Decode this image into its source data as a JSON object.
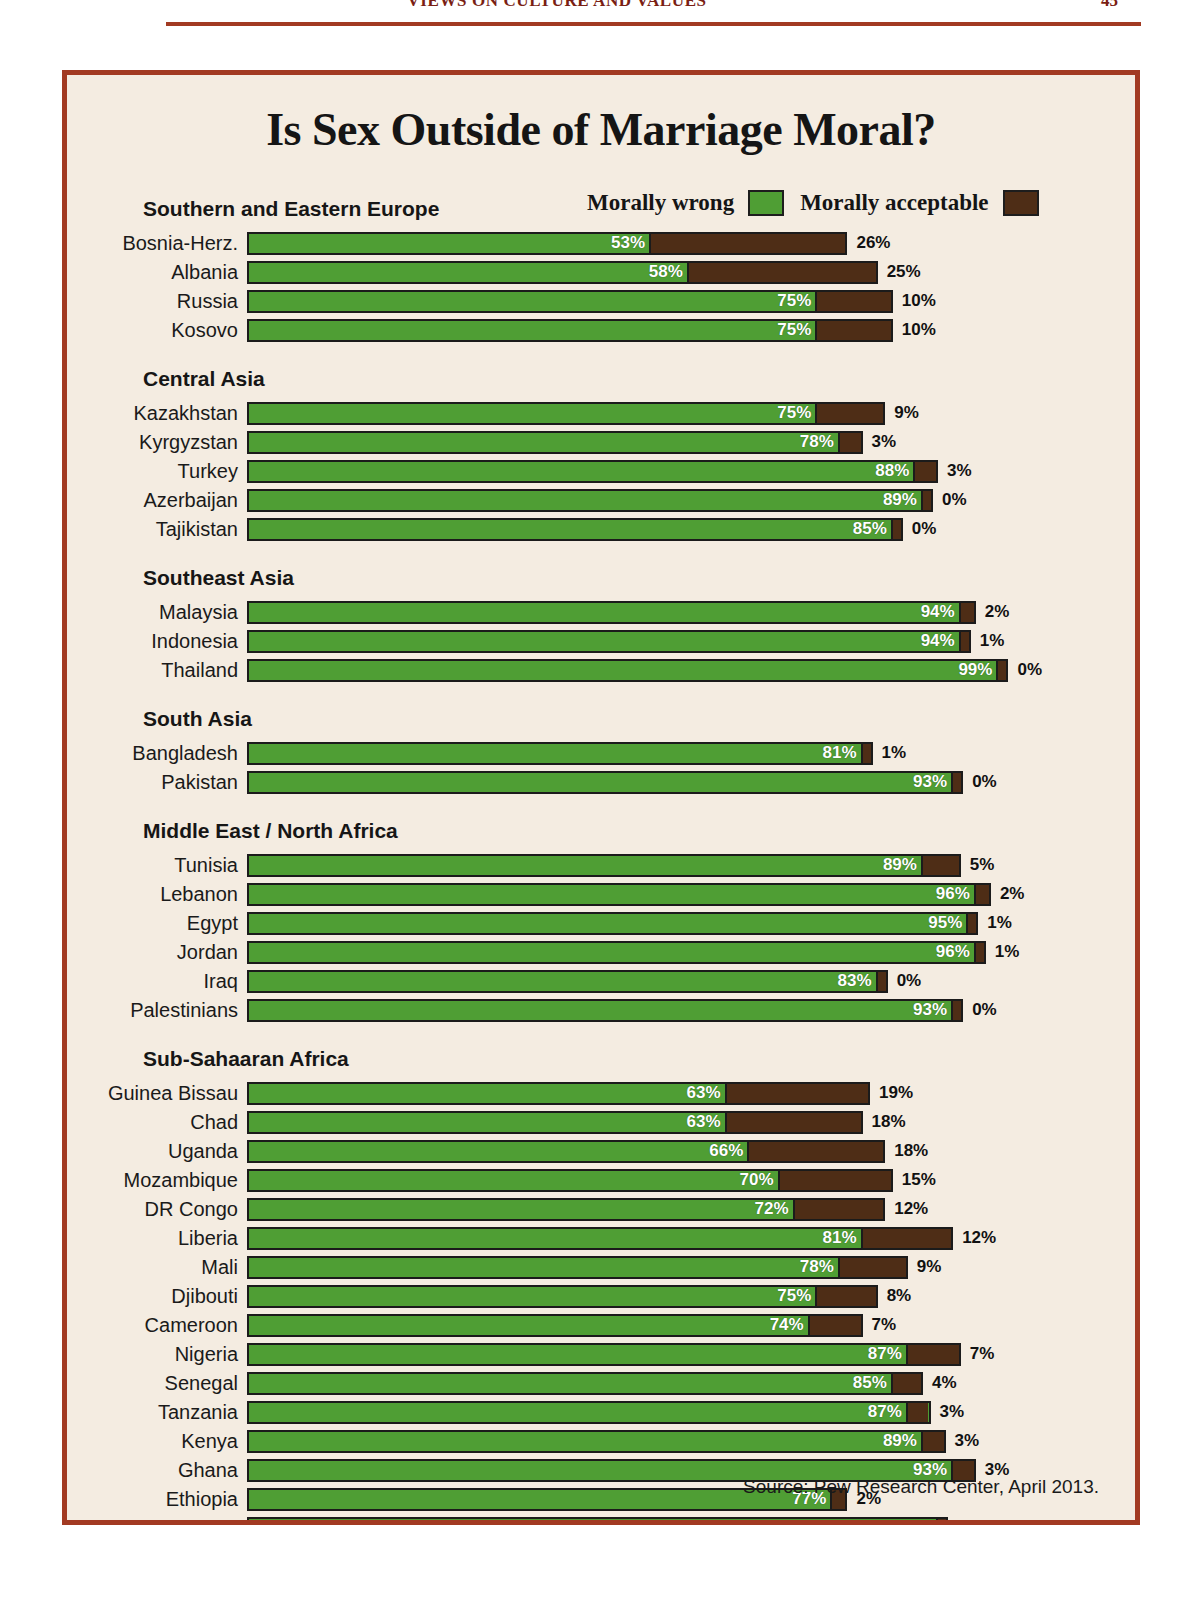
{
  "page_header": {
    "running_head": "VIEWS ON CULTURE AND VALUES",
    "page_number": "45"
  },
  "figure": {
    "title": "Is Sex Outside of Marriage Moral?",
    "source": "Source: Pew Research Center, April 2013.",
    "legend": [
      {
        "label": "Morally wrong",
        "color": "#4f9e34",
        "key": "green"
      },
      {
        "label": "Morally acceptable",
        "color": "#4e2d16",
        "key": "brown"
      }
    ]
  },
  "colors": {
    "frame": "#a23a22",
    "paper": "#f4ece1",
    "morally_wrong": "#4f9e34",
    "morally_acceptable": "#4e2d16",
    "outline": "#1b1b1b"
  },
  "chart_data": {
    "type": "bar",
    "orientation": "horizontal",
    "stacked": true,
    "title": "Is Sex Outside of Marriage Moral?",
    "xlabel": "",
    "ylabel": "",
    "xlim": [
      0,
      100
    ],
    "unit": "%",
    "grid": false,
    "legend_position": "top-right",
    "series": [
      {
        "name": "Morally wrong",
        "color": "#4f9e34"
      },
      {
        "name": "Morally acceptable",
        "color": "#4e2d16"
      }
    ],
    "groups": [
      {
        "name": "Southern and Eastern Europe",
        "rows": [
          {
            "country": "Bosnia-Herz.",
            "wrong": 53,
            "acceptable": 26,
            "wrong_label": "53%",
            "acceptable_label": "26%"
          },
          {
            "country": "Albania",
            "wrong": 58,
            "acceptable": 25,
            "wrong_label": "58%",
            "acceptable_label": "25%"
          },
          {
            "country": "Russia",
            "wrong": 75,
            "acceptable": 10,
            "wrong_label": "75%",
            "acceptable_label": "10%"
          },
          {
            "country": "Kosovo",
            "wrong": 75,
            "acceptable": 10,
            "wrong_label": "75%",
            "acceptable_label": "10%"
          }
        ]
      },
      {
        "name": "Central Asia",
        "rows": [
          {
            "country": "Kazakhstan",
            "wrong": 75,
            "acceptable": 9,
            "wrong_label": "75%",
            "acceptable_label": "9%"
          },
          {
            "country": "Kyrgyzstan",
            "wrong": 78,
            "acceptable": 3,
            "wrong_label": "78%",
            "acceptable_label": "3%"
          },
          {
            "country": "Turkey",
            "wrong": 88,
            "acceptable": 3,
            "wrong_label": "88%",
            "acceptable_label": "3%"
          },
          {
            "country": "Azerbaijan",
            "wrong": 89,
            "acceptable": 0,
            "wrong_label": "89%",
            "acceptable_label": "0%"
          },
          {
            "country": "Tajikistan",
            "wrong": 85,
            "acceptable": 0,
            "wrong_label": "85%",
            "acceptable_label": "0%"
          }
        ]
      },
      {
        "name": "Southeast Asia",
        "rows": [
          {
            "country": "Malaysia",
            "wrong": 94,
            "acceptable": 2,
            "wrong_label": "94%",
            "acceptable_label": "2%"
          },
          {
            "country": "Indonesia",
            "wrong": 94,
            "acceptable": 1,
            "wrong_label": "94%",
            "acceptable_label": "1%"
          },
          {
            "country": "Thailand",
            "wrong": 99,
            "acceptable": 0,
            "wrong_label": "99%",
            "acceptable_label": "0%"
          }
        ]
      },
      {
        "name": "South Asia",
        "rows": [
          {
            "country": "Bangladesh",
            "wrong": 81,
            "acceptable": 1,
            "wrong_label": "81%",
            "acceptable_label": "1%"
          },
          {
            "country": "Pakistan",
            "wrong": 93,
            "acceptable": 0,
            "wrong_label": "93%",
            "acceptable_label": "0%"
          }
        ]
      },
      {
        "name": "Middle East / North Africa",
        "rows": [
          {
            "country": "Tunisia",
            "wrong": 89,
            "acceptable": 5,
            "wrong_label": "89%",
            "acceptable_label": "5%"
          },
          {
            "country": "Lebanon",
            "wrong": 96,
            "acceptable": 2,
            "wrong_label": "96%",
            "acceptable_label": "2%"
          },
          {
            "country": "Egypt",
            "wrong": 95,
            "acceptable": 1,
            "wrong_label": "95%",
            "acceptable_label": "1%"
          },
          {
            "country": "Jordan",
            "wrong": 96,
            "acceptable": 1,
            "wrong_label": "96%",
            "acceptable_label": "1%"
          },
          {
            "country": "Iraq",
            "wrong": 83,
            "acceptable": 0,
            "wrong_label": "83%",
            "acceptable_label": "0%"
          },
          {
            "country": "Palestinians",
            "wrong": 93,
            "acceptable": 0,
            "wrong_label": "93%",
            "acceptable_label": "0%"
          }
        ]
      },
      {
        "name": "Sub-Sahaaran Africa",
        "rows": [
          {
            "country": "Guinea Bissau",
            "wrong": 63,
            "acceptable": 19,
            "wrong_label": "63%",
            "acceptable_label": "19%"
          },
          {
            "country": "Chad",
            "wrong": 63,
            "acceptable": 18,
            "wrong_label": "63%",
            "acceptable_label": "18%"
          },
          {
            "country": "Uganda",
            "wrong": 66,
            "acceptable": 18,
            "wrong_label": "66%",
            "acceptable_label": "18%"
          },
          {
            "country": "Mozambique",
            "wrong": 70,
            "acceptable": 15,
            "wrong_label": "70%",
            "acceptable_label": "15%"
          },
          {
            "country": "DR Congo",
            "wrong": 72,
            "acceptable": 12,
            "wrong_label": "72%",
            "acceptable_label": "12%"
          },
          {
            "country": "Liberia",
            "wrong": 81,
            "acceptable": 12,
            "wrong_label": "81%",
            "acceptable_label": "12%"
          },
          {
            "country": "Mali",
            "wrong": 78,
            "acceptable": 9,
            "wrong_label": "78%",
            "acceptable_label": "9%"
          },
          {
            "country": "Djibouti",
            "wrong": 75,
            "acceptable": 8,
            "wrong_label": "75%",
            "acceptable_label": "8%"
          },
          {
            "country": "Cameroon",
            "wrong": 74,
            "acceptable": 7,
            "wrong_label": "74%",
            "acceptable_label": "7%"
          },
          {
            "country": "Nigeria",
            "wrong": 87,
            "acceptable": 7,
            "wrong_label": "87%",
            "acceptable_label": "7%"
          },
          {
            "country": "Senegal",
            "wrong": 85,
            "acceptable": 4,
            "wrong_label": "85%",
            "acceptable_label": "4%"
          },
          {
            "country": "Tanzania",
            "wrong": 87,
            "acceptable": 3,
            "wrong_label": "87%",
            "acceptable_label": "3%"
          },
          {
            "country": "Kenya",
            "wrong": 89,
            "acceptable": 3,
            "wrong_label": "89%",
            "acceptable_label": "3%"
          },
          {
            "country": "Ghana",
            "wrong": 93,
            "acceptable": 3,
            "wrong_label": "93%",
            "acceptable_label": "3%"
          },
          {
            "country": "Ethiopia",
            "wrong": 77,
            "acceptable": 2,
            "wrong_label": "77%",
            "acceptable_label": "2%"
          },
          {
            "country": "Niger",
            "wrong": 91,
            "acceptable": 1,
            "wrong_label": "91%",
            "acceptable_label": "1%"
          }
        ]
      }
    ]
  }
}
